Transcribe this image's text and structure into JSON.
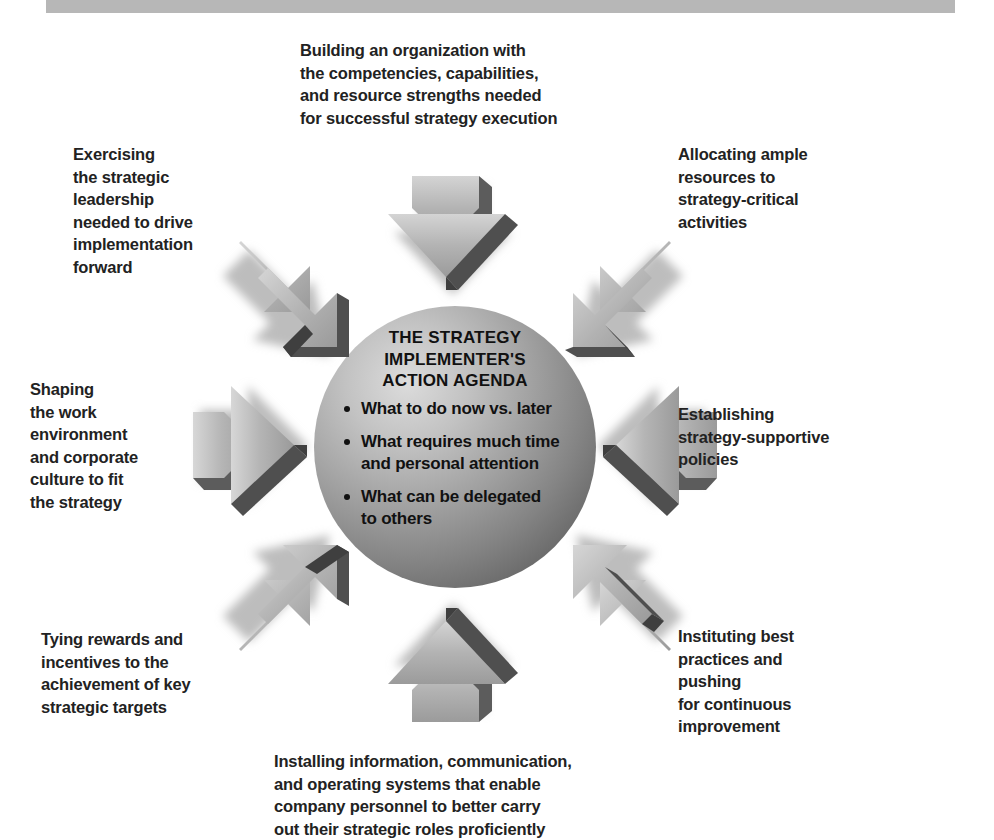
{
  "page": {
    "background_color": "#ffffff",
    "header_band_color": "#b7b7b7",
    "text_color": "#222222",
    "sphere_light_color": "#d8d8d8",
    "sphere_mid_color": "#9a9a9a",
    "sphere_dark_color": "#6e6e6e",
    "arrow_light_color": "#c9c9c9",
    "arrow_mid_color": "#a3a3a3",
    "arrow_dark_color": "#4f4f4f",
    "shadow_color": "#b9b9b9"
  },
  "center": {
    "heading": "THE STRATEGY\nIMPLEMENTER'S\nACTION AGENDA",
    "bullets": [
      "What to do now vs. later",
      "What requires much time\nand personal attention",
      "What can be delegated\nto others"
    ]
  },
  "spokes": {
    "top": {
      "label": "Building an organization with\nthe competencies, capabilities,\nand resource strengths needed\nfor successful strategy execution",
      "arrow": "arrow-down-icon"
    },
    "top_left": {
      "label": "Exercising\nthe strategic\nleadership\nneeded to drive\nimplementation\nforward",
      "arrow": "arrow-down-right-icon"
    },
    "top_right": {
      "label": "Allocating ample\nresources to\nstrategy-critical\nactivities",
      "arrow": "arrow-down-left-icon"
    },
    "left": {
      "label": "Shaping\nthe work\nenvironment\nand corporate\nculture to fit\nthe strategy",
      "arrow": "arrow-right-icon"
    },
    "right": {
      "label": "Establishing\nstrategy-supportive\npolicies",
      "arrow": "arrow-left-icon"
    },
    "bottom_left": {
      "label": "Tying rewards and\nincentives to the\nachievement of key\nstrategic targets",
      "arrow": "arrow-up-right-icon"
    },
    "bottom_right": {
      "label": "Instituting best\npractices and\npushing\nfor continuous\nimprovement",
      "arrow": "arrow-up-left-icon"
    },
    "bottom": {
      "label": "Installing information, communication,\nand operating systems that enable\ncompany personnel to better carry\nout their strategic roles proficiently",
      "arrow": "arrow-up-icon"
    }
  }
}
